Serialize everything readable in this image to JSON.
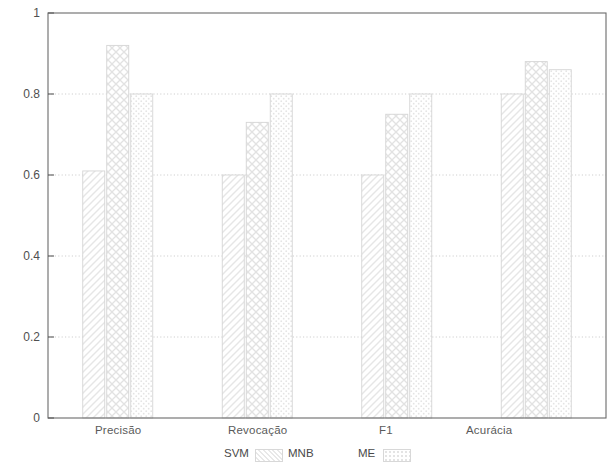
{
  "chart_data": {
    "type": "bar",
    "title": "",
    "xlabel": "",
    "ylabel": "",
    "ylim": [
      0,
      1
    ],
    "ytick_labels": [
      "0",
      "0.2",
      "0.4",
      "0.6",
      "0.8",
      "1"
    ],
    "ytick_values": [
      0,
      0.2,
      0.4,
      0.6,
      0.8,
      1
    ],
    "grid": true,
    "legend_position": "bottom",
    "categories": [
      "Precisão",
      "Revocação",
      "F1",
      "Acurácia"
    ],
    "series": [
      {
        "name": "SVM",
        "values": [
          0.61,
          0.6,
          0.6,
          0.8
        ]
      },
      {
        "name": "MNB",
        "values": [
          0.92,
          0.73,
          0.75,
          0.88
        ]
      },
      {
        "name": "ME",
        "values": [
          0.8,
          0.8,
          0.8,
          0.86
        ]
      }
    ]
  },
  "axis": {
    "y_ticks": [
      {
        "label": "1",
        "value": 1
      },
      {
        "label": "0.8",
        "value": 0.8
      },
      {
        "label": "0.6",
        "value": 0.6
      },
      {
        "label": "0.4",
        "value": 0.4
      },
      {
        "label": "0.2",
        "value": 0.2
      },
      {
        "label": "0",
        "value": 0
      }
    ],
    "x_labels": [
      "Precisão",
      "Revocação",
      "F1",
      "Acurácia"
    ]
  },
  "legend": {
    "entries": [
      {
        "label": "SVM",
        "pattern": "diagonal-hatch"
      },
      {
        "label": "MNB",
        "pattern": "cross-hatch"
      },
      {
        "label": "ME",
        "pattern": "dotted"
      }
    ]
  }
}
